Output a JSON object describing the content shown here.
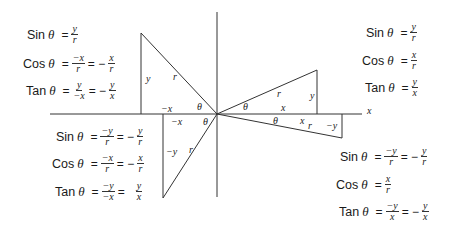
{
  "diagram": {
    "axis_label_x": "x",
    "quadrants": {
      "q1": {
        "triangle_labels": {
          "r": "r",
          "y": "y",
          "x": "x",
          "theta": "θ"
        },
        "equations": [
          {
            "fn": "Sin",
            "theta": "θ",
            "eq": "=",
            "num1": "y",
            "den1": "r"
          },
          {
            "fn": "Cos",
            "theta": "θ",
            "eq": "=",
            "num1": "x",
            "den1": "r"
          },
          {
            "fn": "Tan",
            "theta": "θ",
            "eq": "=",
            "num1": "y",
            "den1": "x"
          }
        ]
      },
      "q2": {
        "triangle_labels": {
          "r": "r",
          "y": "y",
          "x": "−x",
          "theta": "θ"
        },
        "equations": [
          {
            "fn": "Sin",
            "theta": "θ",
            "eq": "=",
            "num1": "y",
            "den1": "r"
          },
          {
            "fn": "Cos",
            "theta": "θ",
            "eq": "=",
            "num1": "−x",
            "den1": "r",
            "eq2": "= −",
            "num2": "x",
            "den2": "r"
          },
          {
            "fn": "Tan",
            "theta": "θ",
            "eq": "=",
            "num1": "y",
            "den1": "−x",
            "eq2": "= −",
            "num2": "y",
            "den2": "x"
          }
        ]
      },
      "q3": {
        "triangle_labels": {
          "r": "r",
          "y": "−y",
          "x": "−x",
          "theta": "θ"
        },
        "equations": [
          {
            "fn": "Sin",
            "theta": "θ",
            "eq": "=",
            "num1": "−y",
            "den1": "r",
            "eq2": "= −",
            "num2": "y",
            "den2": "r"
          },
          {
            "fn": "Cos",
            "theta": "θ",
            "eq": "=",
            "num1": "−x",
            "den1": "r",
            "eq2": "= −",
            "num2": "x",
            "den2": "r"
          },
          {
            "fn": "Tan",
            "theta": "θ",
            "eq": "=",
            "num1": "−y",
            "den1": "−x",
            "eq2": "=",
            "num2": "y",
            "den2": "x"
          }
        ]
      },
      "q4": {
        "triangle_labels": {
          "r": "r",
          "y": "−y",
          "x": "x",
          "theta": "θ"
        },
        "equations": [
          {
            "fn": "Sin",
            "theta": "θ",
            "eq": "=",
            "num1": "−y",
            "den1": "r",
            "eq2": "= −",
            "num2": "y",
            "den2": "r"
          },
          {
            "fn": "Cos",
            "theta": "θ",
            "eq": "=",
            "num1": "x",
            "den1": "r"
          },
          {
            "fn": "Tan",
            "theta": "θ",
            "eq": "=",
            "num1": "−y",
            "den1": "x",
            "eq2": "= −",
            "num2": "y",
            "den2": "x"
          }
        ]
      }
    }
  }
}
